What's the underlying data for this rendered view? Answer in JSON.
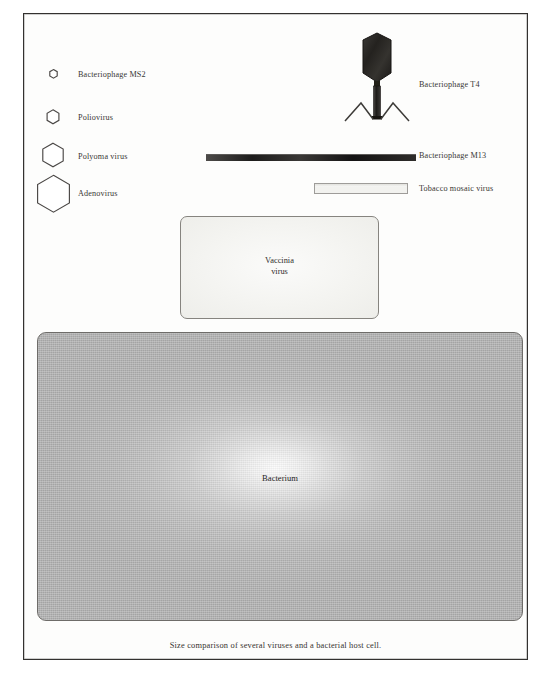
{
  "figure": {
    "caption": "Size comparison of several viruses and a bacterial host cell.",
    "frame_color": "#33312f",
    "background_color": "#ffffff"
  },
  "left_column": {
    "items": [
      {
        "label": "Bacteriophage MS2",
        "icon": "hexagon-icon",
        "size_px": 7
      },
      {
        "label": "Poliovirus",
        "icon": "hexagon-icon",
        "size_px": 11
      },
      {
        "label": "Polyoma virus",
        "icon": "hexagon-icon",
        "size_px": 20
      },
      {
        "label": "Adenovirus",
        "icon": "hexagon-icon",
        "size_px": 32
      }
    ]
  },
  "right_column": {
    "items": [
      {
        "label": "Bacteriophage T4",
        "icon": "bacteriophage-t4-icon"
      },
      {
        "label": "Bacteriophage M13",
        "icon": "filament-bar-icon"
      },
      {
        "label": "Tobacco mosaic virus",
        "icon": "rod-bar-icon"
      }
    ]
  },
  "vaccinia": {
    "line1": "Vaccinia",
    "line2": "virus",
    "fill_color": "#f4f4f1",
    "border_color": "#86847f"
  },
  "bacterium": {
    "label": "Bacterium",
    "fill_color": "#bcbcbc",
    "border_color": "#6e6c69"
  },
  "shapes": {
    "m13_color": "#1d1c1b",
    "tmv_fill": "#f2f2ef",
    "tmv_border": "#9e9c99",
    "phage_head_color": "#2a2826"
  }
}
